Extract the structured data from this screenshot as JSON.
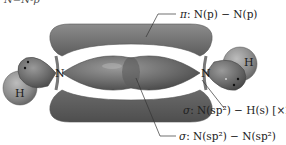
{
  "figure": {
    "title_fragment": "N=N-p",
    "atoms": {
      "n_left": "N",
      "n_right": "N",
      "h_left": "H",
      "h_right": "H"
    },
    "labels": {
      "pi_bond": {
        "greek": "π",
        "text": ": N(p) − N(p)"
      },
      "sigma_nh": {
        "greek": "σ",
        "text": ": N(sp²) − H(s) [×2]"
      },
      "sigma_nn": {
        "greek": "σ",
        "text": ": N(sp²) − N(sp²)"
      }
    },
    "colors": {
      "lobe_dark": "#5f5f5f",
      "lobe_mid": "#7d7d7d",
      "lobe_light": "#a9a9a9",
      "background": "#ffffff",
      "line": "#333333"
    }
  }
}
